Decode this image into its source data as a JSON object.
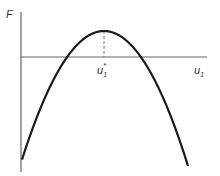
{
  "diagram": {
    "type": "parabola-maximum",
    "y_axis_label": "F",
    "x_axis_label": {
      "base": "u",
      "sub": "1"
    },
    "optimum_label": {
      "base": "u",
      "sub": "1",
      "sup": "*"
    },
    "curve": {
      "shape": "downward parabola",
      "has_maximum": true
    },
    "colors": {
      "curve": "#1a1a1a",
      "axes": "#666666",
      "dashed": "#777777",
      "text": "#333333"
    }
  }
}
